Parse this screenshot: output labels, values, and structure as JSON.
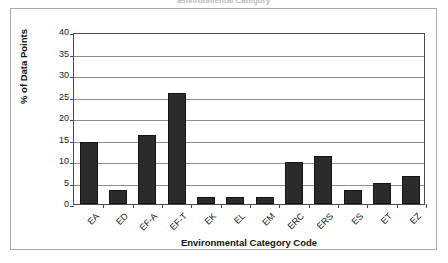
{
  "figure": {
    "title_fragment": "Environmental Category",
    "border_color": "#a8a8a8",
    "background": "#ffffff"
  },
  "chart_data": {
    "type": "bar",
    "title": "",
    "categories": [
      "EA",
      "ED",
      "EF-A",
      "EF-T",
      "EK",
      "EL",
      "EM",
      "ERC",
      "ERS",
      "ES",
      "ET",
      "EZ"
    ],
    "values": [
      14.5,
      3.2,
      16.0,
      25.8,
      1.6,
      1.6,
      1.6,
      9.8,
      11.2,
      3.2,
      4.9,
      6.4
    ],
    "xlabel": "Environmental Category Code",
    "ylabel": "% of Data Points",
    "ylim": [
      0,
      40
    ],
    "ytick_labels": [
      "0",
      "5",
      "10",
      "15",
      "20",
      "25",
      "30",
      "35",
      "40"
    ],
    "ytick_values": [
      0,
      5,
      10,
      15,
      20,
      25,
      30,
      35,
      40
    ],
    "grid": true,
    "grid_axis": "y",
    "legend": false,
    "legend_position": "none",
    "bar_color": "#2b2b2b",
    "grid_color": "#8d8d8d",
    "axis_color": "#4a4a4a"
  }
}
